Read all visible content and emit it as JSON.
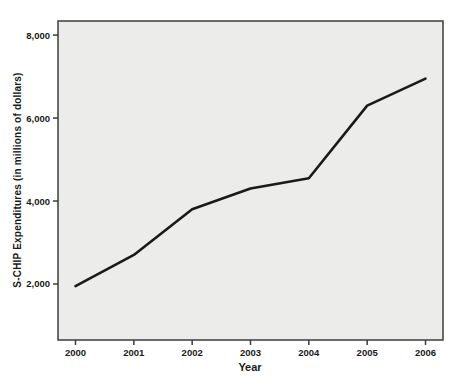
{
  "chart_data": {
    "type": "line",
    "title": "",
    "xlabel": "Year",
    "ylabel": "S-CHIP Expenditures (in millions of dollars)",
    "series_name": "S-CHIP expenditures",
    "x": [
      2000,
      2001,
      2002,
      2003,
      2004,
      2005,
      2006
    ],
    "values": [
      1950,
      2700,
      3800,
      4300,
      4550,
      6300,
      6950
    ],
    "xlim": [
      1999.7,
      2006.3
    ],
    "ylim": [
      650,
      8340
    ],
    "x_ticks": [
      {
        "value": 2000,
        "label": "2000"
      },
      {
        "value": 2001,
        "label": "2001"
      },
      {
        "value": 2002,
        "label": "2002"
      },
      {
        "value": 2003,
        "label": "2003"
      },
      {
        "value": 2004,
        "label": "2004"
      },
      {
        "value": 2005,
        "label": "2005"
      },
      {
        "value": 2006,
        "label": "2006"
      }
    ],
    "y_ticks": [
      {
        "value": 2000,
        "label": "2,000"
      },
      {
        "value": 4000,
        "label": "4,000"
      },
      {
        "value": 6000,
        "label": "6,000"
      },
      {
        "value": 8000,
        "label": "8,000"
      }
    ],
    "grid": false,
    "legend": "none",
    "colors": {
      "line": "#1a1a1a",
      "plot_bg": "#ececea",
      "frame": "#3c3c3c",
      "text": "#1a1a1a",
      "page_bg": "#ffffff"
    }
  }
}
